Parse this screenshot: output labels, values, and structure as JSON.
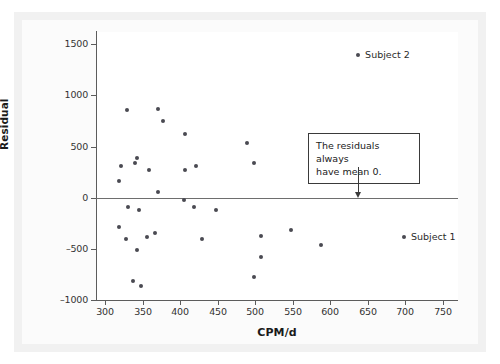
{
  "chart_data": {
    "type": "scatter",
    "title": "",
    "xlabel": "CPM/d",
    "ylabel": "Residual",
    "xlim": [
      288,
      770
    ],
    "ylim": [
      -1000,
      1620
    ],
    "grid": false,
    "legend_position": "none",
    "xticks": [
      300,
      350,
      400,
      450,
      500,
      550,
      600,
      650,
      700,
      750
    ],
    "xticklabels": [
      "300",
      "350",
      "400",
      "450",
      "500",
      "550",
      "600",
      "650",
      "700",
      "750"
    ],
    "yticks": [
      1500,
      1000,
      500,
      0,
      -500,
      -1000
    ],
    "yticklabels": [
      "1500",
      "1000",
      "500",
      "0",
      "–500",
      "–1000"
    ],
    "reference_lines": [
      {
        "name": "zero-line",
        "orientation": "horizontal",
        "y": 0
      }
    ],
    "series": [
      {
        "name": "residuals",
        "marker": "circle",
        "color": "#4a4a52",
        "points": [
          {
            "x": 318,
            "y": 165
          },
          {
            "x": 321,
            "y": 310
          },
          {
            "x": 329,
            "y": 855
          },
          {
            "x": 330,
            "y": -95
          },
          {
            "x": 319,
            "y": -290
          },
          {
            "x": 328,
            "y": -400
          },
          {
            "x": 340,
            "y": 340
          },
          {
            "x": 343,
            "y": 390
          },
          {
            "x": 345,
            "y": -120
          },
          {
            "x": 342,
            "y": -515
          },
          {
            "x": 337,
            "y": -810
          },
          {
            "x": 348,
            "y": -865
          },
          {
            "x": 358,
            "y": 275
          },
          {
            "x": 356,
            "y": -380
          },
          {
            "x": 366,
            "y": -340
          },
          {
            "x": 370,
            "y": 865
          },
          {
            "x": 371,
            "y": 55
          },
          {
            "x": 377,
            "y": 755
          },
          {
            "x": 405,
            "y": -20
          },
          {
            "x": 406,
            "y": 275
          },
          {
            "x": 407,
            "y": 620
          },
          {
            "x": 419,
            "y": -90
          },
          {
            "x": 421,
            "y": 310
          },
          {
            "x": 429,
            "y": -400
          },
          {
            "x": 448,
            "y": -120
          },
          {
            "x": 489,
            "y": 540
          },
          {
            "x": 498,
            "y": 335
          },
          {
            "x": 498,
            "y": -770
          },
          {
            "x": 508,
            "y": -375
          },
          {
            "x": 508,
            "y": -580
          },
          {
            "x": 548,
            "y": -315
          },
          {
            "x": 588,
            "y": -465
          },
          {
            "x": 637,
            "y": 1395
          },
          {
            "x": 698,
            "y": -385
          }
        ]
      }
    ],
    "point_labels": [
      {
        "name": "subject-2-label",
        "text": "Subject 2",
        "x": 637,
        "y": 1395
      },
      {
        "name": "subject-1-label",
        "text": "Subject 1",
        "x": 698,
        "y": -385
      }
    ],
    "annotations": [
      {
        "name": "mean-zero-callout",
        "text": "The residuals always have mean 0.",
        "line1": "The residuals always",
        "line2": "have mean 0.",
        "points_to_x": 637,
        "points_to_y": 0
      }
    ]
  },
  "axes": {
    "x_title": "CPM/d",
    "y_title": "Residual"
  },
  "colors": {
    "marker": "#4a4a52",
    "axis": "#5c5c5c",
    "zero_line": "#6e6e6e",
    "callout_border": "#3a3a3a",
    "panel_background": "#ffffff",
    "figure_background": "#f1f1f1"
  }
}
